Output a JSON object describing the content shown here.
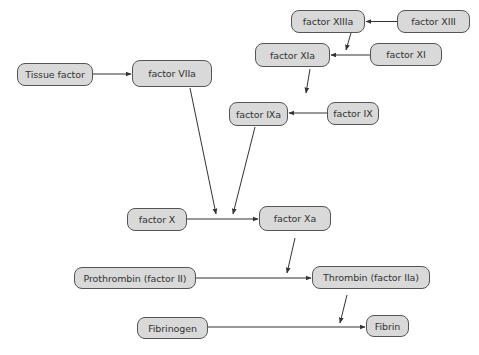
{
  "diagram": {
    "colors": {
      "node_fill": "#d9d9d9",
      "node_border": "#555555",
      "edge": "#333333",
      "text": "#333333",
      "background": "#ffffff"
    },
    "nodes": [
      {
        "id": "xiiia",
        "label": "factor XIIIa",
        "x": 291,
        "y": 10,
        "w": 74,
        "h": 23
      },
      {
        "id": "xiii",
        "label": "factor XIII",
        "x": 397,
        "y": 10,
        "w": 73,
        "h": 23
      },
      {
        "id": "xia",
        "label": "factor XIa",
        "x": 255,
        "y": 43,
        "w": 75,
        "h": 24
      },
      {
        "id": "xi",
        "label": "factor XI",
        "x": 370,
        "y": 43,
        "w": 72,
        "h": 23
      },
      {
        "id": "tf",
        "label": "Tissue factor",
        "x": 17,
        "y": 63,
        "w": 76,
        "h": 23
      },
      {
        "id": "viia",
        "label": "factor VIIa",
        "x": 132,
        "y": 60,
        "w": 80,
        "h": 27
      },
      {
        "id": "ixa",
        "label": "factor IXa",
        "x": 229,
        "y": 102,
        "w": 59,
        "h": 24
      },
      {
        "id": "ix",
        "label": "factor IX",
        "x": 327,
        "y": 102,
        "w": 52,
        "h": 23
      },
      {
        "id": "x",
        "label": "factor X",
        "x": 127,
        "y": 208,
        "w": 60,
        "h": 23
      },
      {
        "id": "xa",
        "label": "factor Xa",
        "x": 259,
        "y": 206,
        "w": 72,
        "h": 25
      },
      {
        "id": "ii",
        "label": "Prothrombin (factor II)",
        "x": 74,
        "y": 267,
        "w": 122,
        "h": 22
      },
      {
        "id": "iia",
        "label": "Thrombin (factor IIa)",
        "x": 312,
        "y": 266,
        "w": 118,
        "h": 23
      },
      {
        "id": "fbg",
        "label": "Fibrinogen",
        "x": 137,
        "y": 317,
        "w": 71,
        "h": 22
      },
      {
        "id": "fb",
        "label": "Fibrin",
        "x": 366,
        "y": 315,
        "w": 43,
        "h": 22
      }
    ],
    "edges": [
      {
        "from": "xiii",
        "to": "xiiia",
        "x1": 397,
        "y1": 21.5,
        "x2": 366,
        "y2": 21.5
      },
      {
        "from": "xiiia",
        "to": "xia-edge",
        "x1": 351,
        "y1": 33,
        "x2": 346,
        "y2": 50
      },
      {
        "from": "xi",
        "to": "xia",
        "x1": 370,
        "y1": 55,
        "x2": 331,
        "y2": 55
      },
      {
        "from": "xia",
        "to": "ixa-edge",
        "x1": 310,
        "y1": 69,
        "x2": 306,
        "y2": 93
      },
      {
        "from": "tf",
        "to": "viia",
        "x1": 93,
        "y1": 74,
        "x2": 131,
        "y2": 74
      },
      {
        "from": "ix",
        "to": "ixa",
        "x1": 327,
        "y1": 113,
        "x2": 289,
        "y2": 113
      },
      {
        "from": "viia",
        "to": "x-xa-edge",
        "x1": 190,
        "y1": 88,
        "x2": 216,
        "y2": 214
      },
      {
        "from": "ixa",
        "to": "x-xa-edge",
        "x1": 255,
        "y1": 127,
        "x2": 233,
        "y2": 214
      },
      {
        "from": "x",
        "to": "xa",
        "x1": 187,
        "y1": 219,
        "x2": 258,
        "y2": 219
      },
      {
        "from": "xa",
        "to": "ii-iia-edge",
        "x1": 295,
        "y1": 238,
        "x2": 287,
        "y2": 273
      },
      {
        "from": "ii",
        "to": "iia",
        "x1": 196,
        "y1": 278,
        "x2": 311,
        "y2": 278
      },
      {
        "from": "iia",
        "to": "fbg-fb-edge",
        "x1": 347,
        "y1": 295,
        "x2": 340,
        "y2": 323
      },
      {
        "from": "fbg",
        "to": "fb",
        "x1": 208,
        "y1": 327,
        "x2": 365,
        "y2": 327
      }
    ]
  }
}
